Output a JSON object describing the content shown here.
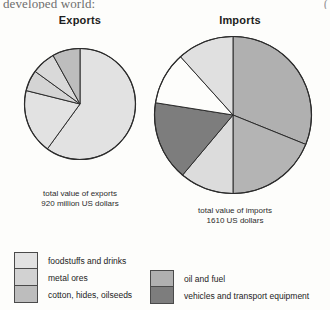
{
  "page": {
    "cut_header_text": "developed world:",
    "cut_corner_text": "("
  },
  "charts": {
    "exports": {
      "title": "Exports",
      "caption_line1": "total value of exports",
      "caption_line2": "920 million US dollars"
    },
    "imports": {
      "title": "Imports",
      "caption_line1": "total value of imports",
      "caption_line2": "1610 US dollars"
    }
  },
  "legend": {
    "left": [
      {
        "label": "foodstuffs and drinks",
        "color": "#e2e2e2"
      },
      {
        "label": "metal ores",
        "color": "#d2d2d2"
      },
      {
        "label": "cotton, hides, oilseeds",
        "color": "#bdbdbd"
      }
    ],
    "right": [
      {
        "label": "oil and fuel",
        "color": "#b0b0b0"
      },
      {
        "label": "vehicles and transport equipment",
        "color": "#7d7d7d"
      }
    ]
  },
  "chart_data": [
    {
      "type": "pie",
      "title": "Exports",
      "subtitle": "total value of exports 920 million US dollars",
      "units": "million US dollars",
      "total": 920,
      "legend_position": "bottom-left",
      "categories": [
        "foodstuffs and drinks",
        "metal ores",
        "cotton, hides, oilseeds",
        "other",
        "other 2"
      ],
      "values": [
        60,
        8,
        7,
        6,
        19
      ],
      "slices": [
        {
          "label": "foodstuffs and drinks",
          "percent": 60,
          "color": "#e2e2e2",
          "start_angle": 0,
          "end_angle": 216
        },
        {
          "label": "unlabeled light",
          "percent": 19,
          "color": "#e2e2e2",
          "start_angle": 216,
          "end_angle": 284
        },
        {
          "label": "cotton, hides, oilseeds",
          "percent": 6,
          "color": "#d4d4d4",
          "start_angle": 284,
          "end_angle": 306
        },
        {
          "label": "metal ores",
          "percent": 7,
          "color": "#d9d9d9",
          "start_angle": 306,
          "end_angle": 331
        },
        {
          "label": "other",
          "percent": 8,
          "color": "#bdbdbd",
          "start_angle": 331,
          "end_angle": 360
        }
      ]
    },
    {
      "type": "pie",
      "title": "Imports",
      "subtitle": "total value of imports 1610 US dollars",
      "units": "US dollars",
      "total": 1610,
      "legend_position": "bottom-right",
      "categories": [
        "oil and fuel",
        "foodstuffs and drinks",
        "metal ores",
        "vehicles and transport equipment",
        "other",
        "cotton, hides, oilseeds"
      ],
      "values": [
        31,
        19,
        11,
        16,
        11,
        12
      ],
      "slices": [
        {
          "label": "oil and fuel",
          "percent": 31,
          "color": "#b0b0b0",
          "start_angle": 0,
          "end_angle": 112
        },
        {
          "label": "oil and fuel 2",
          "percent": 19,
          "color": "#b4b4b4",
          "start_angle": 112,
          "end_angle": 180
        },
        {
          "label": "foodstuffs and drinks",
          "percent": 11,
          "color": "#dcdcdc",
          "start_angle": 180,
          "end_angle": 220
        },
        {
          "label": "vehicles and transport equipment",
          "percent": 16,
          "color": "#7d7d7d",
          "start_angle": 220,
          "end_angle": 279
        },
        {
          "label": "other (white)",
          "percent": 11,
          "color": "#fdfdfb",
          "start_angle": 279,
          "end_angle": 318
        },
        {
          "label": "cotton, hides, oilseeds",
          "percent": 12,
          "color": "#e0e0e0",
          "start_angle": 318,
          "end_angle": 360
        }
      ]
    }
  ]
}
